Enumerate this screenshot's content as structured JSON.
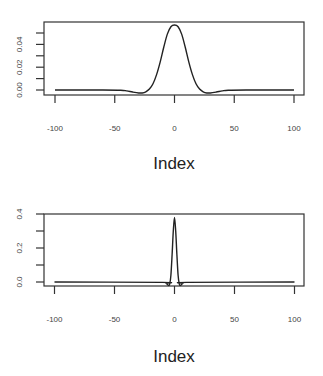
{
  "chart_data": [
    {
      "type": "line",
      "title": "",
      "xlabel": "Index",
      "ylabel": "",
      "xlim": [
        -100,
        100
      ],
      "ylim": [
        -0.004,
        0.058
      ],
      "x_ticks": [
        -100,
        -50,
        0,
        50,
        100
      ],
      "x_tick_labels": [
        "-100",
        "-50",
        "0",
        "50",
        "100"
      ],
      "y_ticks": [
        0.0,
        0.01,
        0.02,
        0.03,
        0.04,
        0.05
      ],
      "y_tick_labels": [
        "0.00",
        "0.02",
        "0.04"
      ],
      "y_tick_label_values": [
        0.0,
        0.02,
        0.04
      ],
      "grid": false,
      "legend": null,
      "series": [
        {
          "name": "kernel",
          "x": [
            -100,
            -60,
            -45,
            -40,
            -35,
            -30,
            -27,
            -24,
            -21,
            -18,
            -15,
            -12,
            -9,
            -6,
            -3,
            0,
            3,
            6,
            9,
            12,
            15,
            18,
            21,
            24,
            27,
            30,
            35,
            40,
            45,
            60,
            100
          ],
          "values": [
            0.0,
            0.0,
            -0.0002,
            -0.0008,
            -0.0018,
            -0.0026,
            -0.0026,
            -0.0016,
            0.0008,
            0.0055,
            0.0135,
            0.0245,
            0.0375,
            0.049,
            0.0555,
            0.057,
            0.0555,
            0.049,
            0.0375,
            0.0245,
            0.0135,
            0.0055,
            0.0008,
            -0.0016,
            -0.0026,
            -0.0026,
            -0.0018,
            -0.0008,
            -0.0002,
            0.0,
            0.0
          ]
        }
      ]
    },
    {
      "type": "line",
      "title": "",
      "xlabel": "Index",
      "ylabel": "",
      "xlim": [
        -100,
        100
      ],
      "ylim": [
        -0.03,
        0.4
      ],
      "x_ticks": [
        -100,
        -50,
        0,
        50,
        100
      ],
      "x_tick_labels": [
        "-100",
        "-50",
        "0",
        "50",
        "100"
      ],
      "y_ticks": [
        0.0,
        0.1,
        0.2,
        0.3,
        0.4
      ],
      "y_tick_labels": [
        "0.0",
        "0.2",
        "0.4"
      ],
      "y_tick_label_values": [
        0.0,
        0.2,
        0.4
      ],
      "grid": false,
      "legend": null,
      "series": [
        {
          "name": "kernel",
          "x": [
            -100,
            -10,
            -7,
            -5,
            -4,
            -3,
            -2,
            -1,
            0,
            1,
            2,
            3,
            4,
            5,
            7,
            10,
            100
          ],
          "values": [
            0.0,
            -0.002,
            -0.008,
            -0.02,
            -0.012,
            0.04,
            0.16,
            0.3,
            0.38,
            0.3,
            0.16,
            0.04,
            -0.012,
            -0.02,
            -0.008,
            -0.002,
            0.0
          ]
        }
      ]
    }
  ]
}
